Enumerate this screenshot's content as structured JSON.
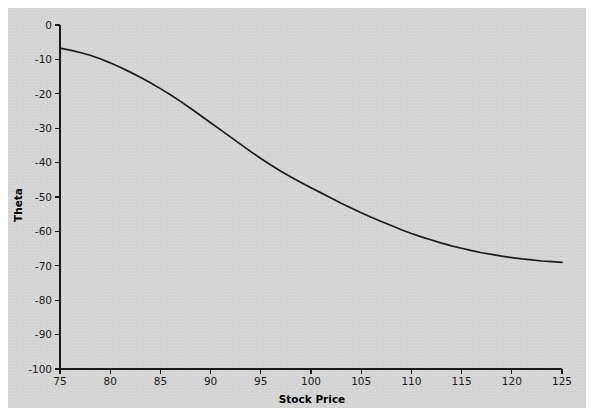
{
  "figure": {
    "background_color": "#d4d4d4",
    "page_color": "#ffffff",
    "panel": {
      "x": 8,
      "y": 8,
      "width": 578,
      "height": 400
    }
  },
  "chart_data": {
    "type": "line",
    "title": "",
    "xlabel": "Stock Price",
    "ylabel": "Theta",
    "xlim": [
      75,
      125
    ],
    "ylim": [
      -100,
      0
    ],
    "grid": false,
    "legend": null,
    "line_color": "#1c1c1c",
    "xticks": [
      75,
      80,
      85,
      90,
      95,
      100,
      105,
      110,
      115,
      120,
      125
    ],
    "xtick_labels": [
      "75",
      "80",
      "85",
      "90",
      "95",
      "100",
      "105",
      "110",
      "115",
      "120",
      "125"
    ],
    "yticks": [
      0,
      -10,
      -20,
      -30,
      -40,
      -50,
      -60,
      -70,
      -80,
      -90,
      -100
    ],
    "ytick_labels": [
      "0",
      "-10",
      "-20",
      "-30",
      "-40",
      "-50",
      "-60",
      "-70",
      "-80",
      "-90",
      "-100"
    ],
    "x": [
      75,
      76,
      77,
      78,
      79,
      80,
      81,
      82,
      83,
      84,
      85,
      86,
      87,
      88,
      89,
      90,
      91,
      92,
      93,
      94,
      95,
      96,
      97,
      98,
      99,
      100,
      101,
      102,
      103,
      104,
      105,
      106,
      107,
      108,
      109,
      110,
      111,
      112,
      113,
      114,
      115,
      116,
      117,
      118,
      119,
      120,
      121,
      122,
      123,
      124,
      125
    ],
    "y": [
      -6.7,
      -7.3,
      -8.0,
      -8.8,
      -9.8,
      -11.0,
      -12.3,
      -13.7,
      -15.2,
      -16.8,
      -18.5,
      -20.3,
      -22.2,
      -24.2,
      -26.3,
      -28.4,
      -30.5,
      -32.6,
      -34.7,
      -36.8,
      -38.8,
      -40.7,
      -42.5,
      -44.2,
      -45.8,
      -47.3,
      -48.8,
      -50.3,
      -51.8,
      -53.2,
      -54.6,
      -55.9,
      -57.1,
      -58.3,
      -59.5,
      -60.6,
      -61.6,
      -62.5,
      -63.4,
      -64.2,
      -64.9,
      -65.6,
      -66.2,
      -66.7,
      -67.2,
      -67.6,
      -68.0,
      -68.3,
      -68.6,
      -68.8,
      -69.0
    ],
    "series": [
      {
        "name": "Theta",
        "values": [
          -6.7,
          -7.3,
          -8.0,
          -8.8,
          -9.8,
          -11.0,
          -12.3,
          -13.7,
          -15.2,
          -16.8,
          -18.5,
          -20.3,
          -22.2,
          -24.2,
          -26.3,
          -28.4,
          -30.5,
          -32.6,
          -34.7,
          -36.8,
          -38.8,
          -40.7,
          -42.5,
          -44.2,
          -45.8,
          -47.3,
          -48.8,
          -50.3,
          -51.8,
          -53.2,
          -54.6,
          -55.9,
          -57.1,
          -58.3,
          -59.5,
          -60.6,
          -61.6,
          -62.5,
          -63.4,
          -64.2,
          -64.9,
          -65.6,
          -66.2,
          -66.7,
          -67.2,
          -67.6,
          -68.0,
          -68.3,
          -68.6,
          -68.8,
          -69.0
        ]
      }
    ]
  }
}
